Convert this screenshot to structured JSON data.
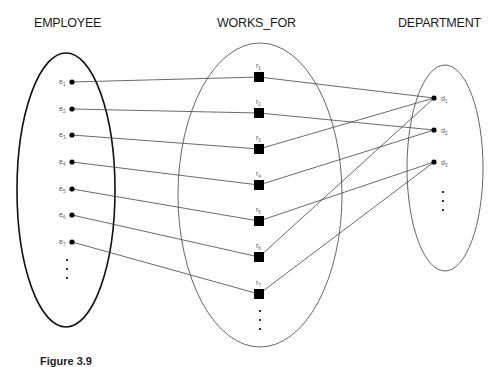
{
  "titles": {
    "entity_left": "EMPLOYEE",
    "relationship": "WORKS_FOR",
    "entity_right": "DEPARTMENT"
  },
  "diagram": {
    "type": "relationship-instance-mapping",
    "employees": [
      {
        "label": "e",
        "sub": "1"
      },
      {
        "label": "e",
        "sub": "2"
      },
      {
        "label": "e",
        "sub": "3"
      },
      {
        "label": "e",
        "sub": "4"
      },
      {
        "label": "e",
        "sub": "5"
      },
      {
        "label": "e",
        "sub": "6"
      },
      {
        "label": "e",
        "sub": "7"
      }
    ],
    "relationships": [
      {
        "label": "r",
        "sub": "1"
      },
      {
        "label": "r",
        "sub": "2"
      },
      {
        "label": "r",
        "sub": "3"
      },
      {
        "label": "r",
        "sub": "4"
      },
      {
        "label": "r",
        "sub": "5"
      },
      {
        "label": "r",
        "sub": "6"
      },
      {
        "label": "r",
        "sub": "7"
      }
    ],
    "departments": [
      {
        "label": "d",
        "sub": "1"
      },
      {
        "label": "d",
        "sub": "2"
      },
      {
        "label": "d",
        "sub": "3"
      }
    ],
    "links": [
      {
        "employee": "e1",
        "relationship": "r1",
        "department": "d1"
      },
      {
        "employee": "e2",
        "relationship": "r2",
        "department": "d2"
      },
      {
        "employee": "e3",
        "relationship": "r3",
        "department": "d1"
      },
      {
        "employee": "e4",
        "relationship": "r4",
        "department": "d2"
      },
      {
        "employee": "e5",
        "relationship": "r5",
        "department": "d3"
      },
      {
        "employee": "e6",
        "relationship": "r6",
        "department": "d1"
      },
      {
        "employee": "e7",
        "relationship": "r7",
        "department": "d3"
      }
    ],
    "continuation_marker": "⋮"
  },
  "caption": {
    "figure_label": "Figure 3.9"
  }
}
